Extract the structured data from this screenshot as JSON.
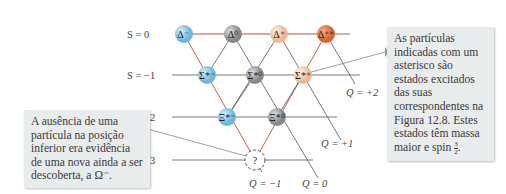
{
  "strangeness_labels": [
    "S = 0",
    "S = −1",
    "S = −2",
    "S = −3"
  ],
  "charge_labels": [
    "Q = +2",
    "Q = +1",
    "Q = −1",
    "Q = 0"
  ],
  "particles": [
    {
      "symbol": "Δ",
      "sup": "−",
      "row": 0,
      "color": "#8ecae6"
    },
    {
      "symbol": "Δ",
      "sup": "0",
      "row": 0,
      "color": "#9a9a9a"
    },
    {
      "symbol": "Δ",
      "sup": "+",
      "row": 0,
      "color": "#f6cfb1"
    },
    {
      "symbol": "Δ",
      "sup": "++",
      "row": 0,
      "color": "#e07a43"
    },
    {
      "symbol": "Σ",
      "sup": "*−",
      "row": 1,
      "color": "#8ecae6"
    },
    {
      "symbol": "Σ",
      "sup": "*0",
      "row": 1,
      "color": "#9a9a9a"
    },
    {
      "symbol": "Σ",
      "sup": "*+",
      "row": 1,
      "color": "#f6cfb1"
    },
    {
      "symbol": "Ξ",
      "sup": "*−",
      "row": 2,
      "color": "#8ecae6"
    },
    {
      "symbol": "Ξ",
      "sup": "*0",
      "row": 2,
      "color": "#9a9a9a"
    },
    {
      "symbol": "?",
      "sup": "",
      "row": 3,
      "color": "#ffffff"
    }
  ],
  "notes": {
    "right": "As partículas indicadas com um asterisco são estados excitados das suas correspondentes na Figura 12.8. Estes estados têm massa maior e spin",
    "right_frac_num": "3",
    "right_frac_den": "2",
    "left": "A ausência de uma partícula na posição inferior era evidência de uma nova ainda a ser descoberta, a Ω⁻."
  },
  "colors": {
    "line_red": "#b5533a",
    "line_gray": "#555555",
    "note_bg": "#e9ecec"
  }
}
